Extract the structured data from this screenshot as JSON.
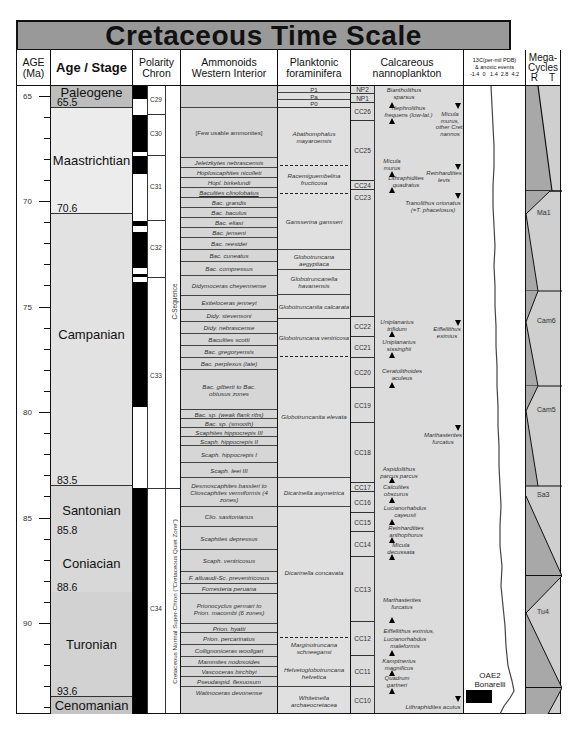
{
  "title": "Cretaceous Time Scale",
  "headers": {
    "age": "AGE\n(Ma)",
    "age_l1": "AGE",
    "age_l2": "(Ma)",
    "stage": "Age / Stage",
    "polarity_l1": "Polarity",
    "polarity_l2": "Chron",
    "ammonoids_l1": "Ammonoids",
    "ammonoids_l2": "Western Interior",
    "forams_l1": "Planktonic",
    "forams_l2": "foraminifera",
    "nanno_l1": "Calcareous",
    "nanno_l2": "nannoplankton",
    "carbon_l1": "13C(per-mil PDB)",
    "carbon_l2": "& anoxic events",
    "carbon_ticks": "-1.4  0   1.4  2.8  4.2",
    "mega_l1": "Mega-",
    "mega_l2": "Cycles",
    "mega_l3": "R    T"
  },
  "age_ticks": [
    "65",
    "70",
    "75",
    "80",
    "85",
    "90"
  ],
  "stages": [
    {
      "name": "Paleogene",
      "boundary": "65.5"
    },
    {
      "name": "Maastrichtian",
      "boundary": "70.6"
    },
    {
      "name": "Campanian",
      "boundary": "83.5"
    },
    {
      "name": "Santonian",
      "boundary": "85.8"
    },
    {
      "name": "Coniacian",
      "boundary": "88.6"
    },
    {
      "name": "Turonian",
      "boundary": "93.6"
    },
    {
      "name": "Cenomanian",
      "boundary": ""
    }
  ],
  "chrons": [
    "C29",
    "C30",
    "C31",
    "C32",
    "C33",
    "C34"
  ],
  "sequences": {
    "c_sequence": "C-Sequence",
    "quiet_zone": "Cretaceous Normal Super-Chron (\"Cretaceous Quiet Zone\")"
  },
  "ammonoids": [
    "[Few usable ammonites]",
    "Jeletzkytes nebrascensis",
    "Hoploscaphites nicolleti",
    "Hopl. birkelundi",
    "Baculites clinolobatus",
    "Bac. grandis",
    "Bac. baculus",
    "Bac. eliasi",
    "Bac. jenseni",
    "Bac. reesidei",
    "Bac. cuneatus",
    "Bac. compressus",
    "Didymoceras cheyennense",
    "Exiteloceras jenneyi",
    "Didy. stevensoni",
    "Didy. nebrascense",
    "Baculites scotti",
    "Bac. gregoryensis",
    "Bac. perplexus (late)",
    "Bac. gilberti to Bac. obtusus zones",
    "Bac. sp. (weak flank ribs)",
    "Bac. sp. (smooth)",
    "Scaphites hippocrepis III",
    "Scaph. hippocrepis II",
    "Scaph. hippocrepis I",
    "Scaph. leei III",
    "Desmoscaphites bassleri to Clioscaphites vermiformis (4 zones)",
    "Clio. saxitonianus",
    "Scaphites depressus",
    "Scaph. ventricosus",
    "F. alluaudi-Sc. preventricosus",
    "Forresteria peruana",
    "Prionocyclus germari to Prion. macombi (6 zones)",
    "Prion. hyatti",
    "Prion. percarinatus",
    "Collignoniceras woollgari",
    "Mammites nodosoides",
    "Vascoceras birchbyi",
    "Pseudaspid. flexuosum",
    "Watinoceras devonense"
  ],
  "forams": [
    "P1",
    "Pa",
    "P0",
    "Abathomphalus mayaroensis",
    "Racemiguembelina fructicosa",
    "Gansserina gansseri",
    "Globotruncana aegyptiaca",
    "Globotruncanella havanensis",
    "Globotruncanita calcarata",
    "Globotruncana ventricosa",
    "Globotruncanita elevata",
    "Dicarinella asymetrica",
    "Dicarinella concavata",
    "Marginotruncana schneegansi",
    "Helvetoglobotruncana helvetica",
    "Whiteinella archaeocretacea"
  ],
  "nanno_zones": [
    "NP2",
    "NP1",
    "CC26",
    "CC25",
    "CC24",
    "CC23",
    "CC22",
    "CC21",
    "CC20",
    "CC19",
    "CC18",
    "CC17",
    "CC16",
    "CC15",
    "CC14",
    "CC13",
    "CC12",
    "CC11",
    "CC10"
  ],
  "nanno_events": [
    "Biantholithus sparsus",
    "Nephrolithus frequens (low-lat.)",
    "Micula murus, other Cret. nannos",
    "Micula murus",
    "Reinhardtites levis",
    "Lithraphidites quadratus",
    "Tranolithus orionatus (=T. phacelosus)",
    "Uniplanarius trifidum",
    "Eiffellithus eximius",
    "Uniplanarius sissinghii",
    "Ceratolithoides aculeus",
    "Marthasterites furcatus",
    "Aspidolithus parcus parcus",
    "Calculites obscurus",
    "Lucianorhabdus cayeuxii",
    "Reinhardtites anthophorus",
    "Micula decussata",
    "Marthasterites furcatus",
    "Eiffellithus eximius,",
    "Lucianorhabdus maleformis",
    "Kamptnerius magnificus",
    "Quadrum gartneri",
    "Lithraphidites acutus"
  ],
  "anoxic_event": {
    "l1": "OAE2",
    "l2": "Bonarelli"
  },
  "megacycles": [
    "Ma1",
    "Cam6",
    "Cam5",
    "Sa3",
    "Tu4"
  ],
  "colors": {
    "title_bg": "#999999",
    "stage_gray": "#d4d4d4",
    "paleogene": "#b8b8b8",
    "col_bg": "#dcdcdc",
    "border": "#111111"
  }
}
